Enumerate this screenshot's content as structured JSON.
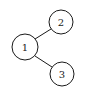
{
  "diagram": {
    "type": "tree",
    "nodes": [
      {
        "id": "1",
        "label": "1",
        "cx": 25,
        "cy": 47,
        "r": 13
      },
      {
        "id": "2",
        "label": "2",
        "cx": 61,
        "cy": 22,
        "r": 12
      },
      {
        "id": "3",
        "label": "3",
        "cx": 62,
        "cy": 74,
        "r": 12
      }
    ],
    "edges": [
      {
        "from": "1",
        "to": "2"
      },
      {
        "from": "1",
        "to": "3"
      }
    ],
    "colors": {
      "stroke": "#1a1a1a",
      "background": "#ffffff"
    }
  }
}
